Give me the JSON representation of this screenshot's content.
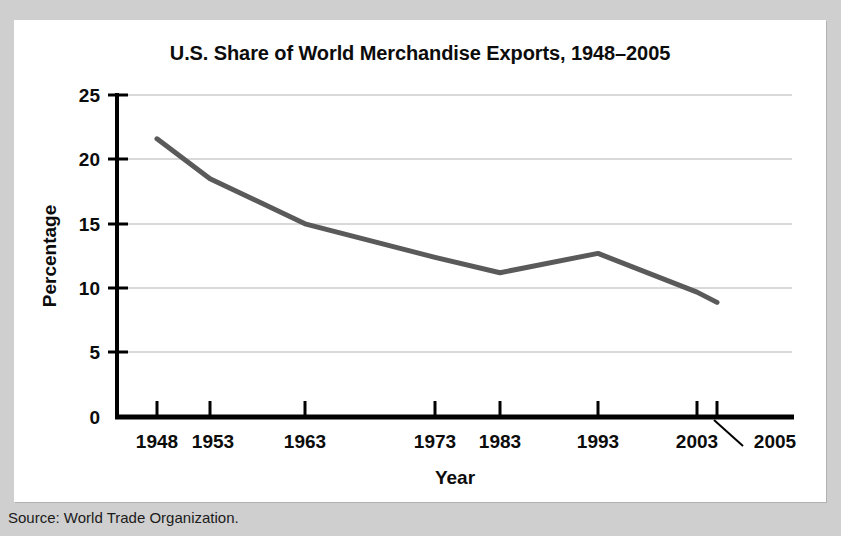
{
  "figure": {
    "background_color": "#cfcfcf",
    "panel_color": "#ffffff",
    "source_note": "Source: World Trade Organization."
  },
  "chart_data": {
    "type": "line",
    "title": "U.S. Share of World Merchandise Exports, 1948–2005",
    "xlabel": "Year",
    "ylabel": "Percentage",
    "x": [
      1948,
      1953,
      1963,
      1973,
      1983,
      1993,
      2003,
      2005
    ],
    "categories": [
      "1948",
      "1953",
      "1963",
      "1973",
      "1983",
      "1993",
      "2003",
      "2005"
    ],
    "values": [
      21.6,
      18.5,
      15.0,
      12.4,
      11.2,
      12.7,
      9.7,
      8.9
    ],
    "series": [
      {
        "name": "U.S. share of world merchandise exports",
        "values": [
          21.6,
          18.5,
          15.0,
          12.4,
          11.2,
          12.7,
          9.7,
          8.9
        ],
        "color": "#5a5a5a"
      }
    ],
    "ylim": [
      0,
      25
    ],
    "ytick_labels": [
      "0",
      "5",
      "10",
      "15",
      "20",
      "25"
    ],
    "ytick_values": [
      0,
      5,
      10,
      15,
      20,
      25
    ],
    "xtick_labels": [
      "1948",
      "1953",
      "1963",
      "1973",
      "1983",
      "1993",
      "2003",
      "2005"
    ],
    "grid": true,
    "grid_axis": "y",
    "grid_color": "#d9d9d9",
    "legend": false,
    "annotations": [
      {
        "text": "2005",
        "note": "label offset to the right of the 2005 tick, connected by a leader line"
      }
    ],
    "line_color": "#5a5a5a",
    "line_width": 5,
    "axis_color": "#000000"
  }
}
